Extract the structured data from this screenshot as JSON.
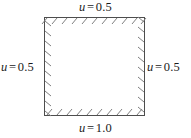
{
  "figure": {
    "type": "boundary-condition-diagram",
    "domain_shape": "square",
    "interior_fill": "#ffffff",
    "line_color": "#4d4d4d",
    "text_color": "#1a1a1a",
    "hatching": {
      "style": "diagonal-tick-marks",
      "side": "interior",
      "edges": [
        "top",
        "right",
        "bottom",
        "left"
      ]
    },
    "geometry": {
      "left": 44,
      "top": 17,
      "right": 145,
      "bottom": 116
    }
  },
  "labels": {
    "top": {
      "variable": "u",
      "equals": "=",
      "value": "0.5"
    },
    "right": {
      "variable": "u",
      "equals": "=",
      "value": "0.5"
    },
    "bottom": {
      "variable": "u",
      "equals": "=",
      "value": "1.0"
    },
    "left": {
      "variable": "u",
      "equals": "=",
      "value": "0.5"
    }
  }
}
